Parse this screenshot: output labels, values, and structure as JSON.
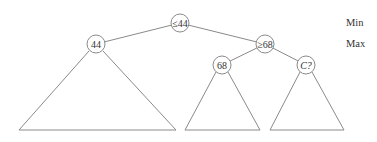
{
  "diagram": {
    "type": "minimax-game-tree",
    "level_labels": [
      {
        "id": "min",
        "text": "Min",
        "x": 346,
        "y": 26
      },
      {
        "id": "max",
        "text": "Max",
        "x": 346,
        "y": 47
      }
    ],
    "nodes": [
      {
        "id": "root",
        "label": "≤44",
        "cx": 180,
        "cy": 23,
        "r": 9,
        "italic": false
      },
      {
        "id": "n44",
        "label": "44",
        "cx": 96,
        "cy": 44,
        "r": 9,
        "italic": false
      },
      {
        "id": "n68max",
        "label": "≥68",
        "cx": 265,
        "cy": 44,
        "r": 9,
        "italic": false
      },
      {
        "id": "n68",
        "label": "68",
        "cx": 222,
        "cy": 65,
        "r": 9,
        "italic": false
      },
      {
        "id": "nC",
        "label": "C?",
        "cx": 306,
        "cy": 65,
        "r": 9,
        "italic": true
      }
    ],
    "edges": [
      {
        "from": "root",
        "to": "n44"
      },
      {
        "from": "root",
        "to": "n68max"
      },
      {
        "from": "n68max",
        "to": "n68"
      },
      {
        "from": "n68max",
        "to": "nC"
      }
    ],
    "subtrees": [
      {
        "id": "subtree-44",
        "apex_left": [
          89,
          51
        ],
        "apex_right": [
          103,
          51
        ],
        "base_left": [
          19,
          130
        ],
        "base_right": [
          176,
          130
        ]
      },
      {
        "id": "subtree-68",
        "apex_left": [
          216,
          72
        ],
        "apex_right": [
          228,
          72
        ],
        "base_left": [
          185,
          130
        ],
        "base_right": [
          260,
          130
        ]
      },
      {
        "id": "subtree-C",
        "apex_left": [
          300,
          72
        ],
        "apex_right": [
          312,
          72
        ],
        "base_left": [
          270,
          130
        ],
        "base_right": [
          344,
          130
        ]
      }
    ],
    "colors": {
      "line": "#8a8a8a",
      "text": "#333333",
      "background": "#ffffff"
    }
  }
}
